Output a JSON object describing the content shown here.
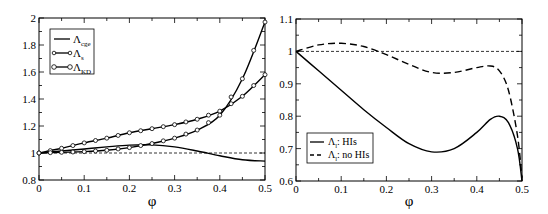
{
  "chart_data": [
    {
      "type": "line",
      "panel": "left",
      "title": "",
      "xlabel": "φ",
      "ylabel": "",
      "xlim": [
        0,
        0.5
      ],
      "ylim": [
        0.8,
        2.0
      ],
      "x_ticks": [
        "0",
        "0.1",
        "0.2",
        "0.3",
        "0.4",
        "0.5"
      ],
      "y_ticks": [
        "0.8",
        "1",
        "1.2",
        "1.4",
        "1.6",
        "1.8",
        "2"
      ],
      "grid": false,
      "legend_position": "upper-left",
      "reference_line": {
        "y": 1.0,
        "style": "dashed"
      },
      "series": [
        {
          "name": "Λcge",
          "label_main": "Λ",
          "label_sub": "cge",
          "style": "solid",
          "marker": "none",
          "x": [
            0,
            0.05,
            0.1,
            0.15,
            0.2,
            0.25,
            0.3,
            0.35,
            0.4,
            0.45,
            0.5
          ],
          "y": [
            1.0,
            1.015,
            1.03,
            1.045,
            1.058,
            1.06,
            1.045,
            1.015,
            0.98,
            0.95,
            0.94
          ]
        },
        {
          "name": "Λs",
          "label_main": "Λ",
          "label_sub": "s",
          "style": "solid",
          "marker": "circle",
          "x": [
            0,
            0.05,
            0.1,
            0.15,
            0.2,
            0.25,
            0.3,
            0.35,
            0.4,
            0.45,
            0.5
          ],
          "y": [
            1.0,
            1.035,
            1.075,
            1.11,
            1.15,
            1.18,
            1.21,
            1.25,
            1.31,
            1.42,
            1.58
          ]
        },
        {
          "name": "ΛKD",
          "label_main": "Λ",
          "label_sub": "KD",
          "style": "solid",
          "marker": "circle",
          "x": [
            0,
            0.05,
            0.1,
            0.15,
            0.2,
            0.25,
            0.3,
            0.35,
            0.4,
            0.45,
            0.5
          ],
          "y": [
            1.0,
            1.005,
            1.01,
            1.02,
            1.04,
            1.07,
            1.11,
            1.17,
            1.28,
            1.55,
            1.97
          ]
        }
      ]
    },
    {
      "type": "line",
      "panel": "right",
      "title": "",
      "xlabel": "φ",
      "ylabel": "",
      "xlim": [
        0,
        0.5
      ],
      "ylim": [
        0.6,
        1.1
      ],
      "x_ticks": [
        "0",
        "0.1",
        "0.2",
        "0.3",
        "0.4",
        "0.5"
      ],
      "y_ticks": [
        "0.6",
        "0.7",
        "0.8",
        "0.9",
        "1",
        "1.1"
      ],
      "grid": false,
      "legend_position": "lower-left",
      "reference_line": {
        "y": 1.0,
        "style": "dashed"
      },
      "series": [
        {
          "name": "Λl: HIs",
          "label_main": "Λ",
          "label_sub": "l",
          "label_suffix": ": HIs",
          "style": "solid",
          "x": [
            0,
            0.05,
            0.1,
            0.15,
            0.2,
            0.25,
            0.3,
            0.35,
            0.4,
            0.43,
            0.45,
            0.47,
            0.49,
            0.5
          ],
          "y": [
            1.0,
            0.94,
            0.88,
            0.82,
            0.765,
            0.715,
            0.69,
            0.7,
            0.75,
            0.79,
            0.8,
            0.78,
            0.7,
            0.6
          ]
        },
        {
          "name": "Λl: no HIs",
          "label_main": "Λ",
          "label_sub": "l",
          "label_suffix": ": no HIs",
          "style": "dashed",
          "x": [
            0,
            0.05,
            0.1,
            0.15,
            0.2,
            0.25,
            0.3,
            0.35,
            0.4,
            0.43,
            0.45,
            0.47,
            0.49,
            0.5
          ],
          "y": [
            1.0,
            1.02,
            1.025,
            1.015,
            0.99,
            0.96,
            0.935,
            0.935,
            0.95,
            0.955,
            0.94,
            0.88,
            0.74,
            0.61
          ]
        }
      ]
    }
  ],
  "left": {
    "xlabel": "φ",
    "x_ticks": [
      "0",
      "0.1",
      "0.2",
      "0.3",
      "0.4",
      "0.5"
    ],
    "y_ticks": [
      "0.8",
      "1",
      "1.2",
      "1.4",
      "1.6",
      "1.8",
      "2"
    ],
    "legend": [
      {
        "main": "Λ",
        "sub": "cge"
      },
      {
        "main": "Λ",
        "sub": "s"
      },
      {
        "main": "Λ",
        "sub": "KD"
      }
    ]
  },
  "right": {
    "xlabel": "φ",
    "x_ticks": [
      "0",
      "0.1",
      "0.2",
      "0.3",
      "0.4",
      "0.5"
    ],
    "y_ticks": [
      "0.6",
      "0.7",
      "0.8",
      "0.9",
      "1",
      "1.1"
    ],
    "legend": [
      {
        "main": "Λ",
        "sub": "l",
        "suffix": ": HIs"
      },
      {
        "main": "Λ",
        "sub": "l",
        "suffix": ": no HIs"
      }
    ]
  }
}
